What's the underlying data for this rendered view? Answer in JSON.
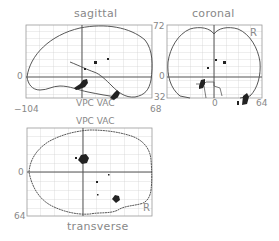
{
  "figure": {
    "panels": {
      "sagittal": {
        "title": "sagittal",
        "ylabel_top": "",
        "ylabel_zero": "0",
        "ylabel_bottom": "",
        "xlabel_left": "−104",
        "xlabel_right": "68",
        "crosshair_label": "VPC VAC"
      },
      "coronal": {
        "title": "coronal",
        "ylabel_top": "72",
        "ylabel_zero": "0",
        "ylabel_bottom": "32",
        "xlabel_zero": "0",
        "xlabel_right": "64",
        "side_marker": "R"
      },
      "transverse": {
        "title": "transverse",
        "top_label": "VPC VAC",
        "ylabel_zero": "0",
        "ylabel_bottom": "64",
        "side_marker": "R"
      }
    },
    "colors": {
      "outline": "#444444",
      "grid": "#cfcfcf",
      "frame": "#999999",
      "blob": "#222222",
      "text": "#888888"
    }
  }
}
